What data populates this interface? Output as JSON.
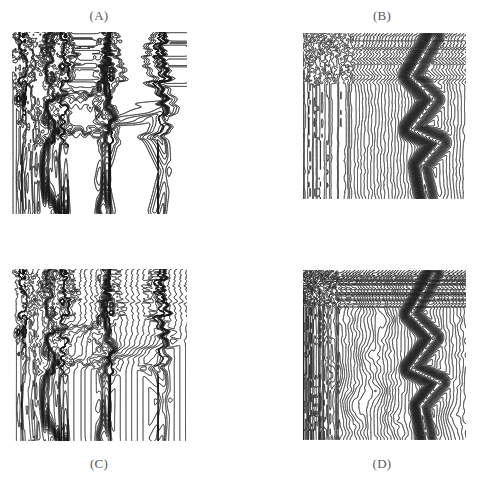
{
  "figure": {
    "kind": "multi-panel-contour-figure",
    "background_color": "#ffffff",
    "ink_color": "#1a1a1a",
    "label_color": "#58585a",
    "width": 477,
    "height": 484,
    "panel_count": 4,
    "layout": "2x2"
  },
  "panels": [
    {
      "id": "A",
      "label": "(A)",
      "label_position": "above",
      "label_x": 59,
      "label_y": 8,
      "plot_x": 12,
      "plot_y": 32,
      "plot_w": 175,
      "plot_h": 182
    },
    {
      "id": "B",
      "label": "(B)",
      "label_position": "above",
      "label_x": 342,
      "label_y": 8,
      "plot_x": 303,
      "plot_y": 33,
      "plot_w": 163,
      "plot_h": 166
    },
    {
      "id": "C",
      "label": "(C)",
      "label_position": "below",
      "label_x": 59,
      "label_y": 456,
      "plot_x": 12,
      "plot_y": 269,
      "plot_w": 175,
      "plot_h": 172
    },
    {
      "id": "D",
      "label": "(D)",
      "label_position": "below",
      "label_x": 342,
      "label_y": 456,
      "plot_x": 303,
      "plot_y": 270,
      "plot_w": 163,
      "plot_h": 170
    }
  ],
  "caption_ghost_text": "",
  "chart_data": [
    {
      "panel": "A",
      "type": "contour",
      "title": "(A)",
      "xlabel": "",
      "ylabel": "",
      "xlim": [
        0,
        1
      ],
      "ylim": [
        0,
        1
      ],
      "grid": false,
      "legend": "none",
      "n_levels": 46,
      "level_min": 0.0,
      "level_max": 1.0,
      "line_width": 0.45,
      "description": "Piecewise-flat field: broad white plateaus separated by near-vertical black fault bands; contours bunch into thick dark seams along the plateau boundaries.",
      "field_model": "plateau",
      "seeds": [
        11,
        7
      ],
      "plateaus": [
        {
          "level": 0.08,
          "cx": 0.12,
          "cy": 0.5,
          "rx": 0.11,
          "ry": 0.52
        },
        {
          "level": 0.3,
          "cx": 0.36,
          "cy": 0.2,
          "rx": 0.17,
          "ry": 0.18
        },
        {
          "level": 0.46,
          "cx": 0.36,
          "cy": 0.45,
          "rx": 0.18,
          "ry": 0.11
        },
        {
          "level": 0.58,
          "cx": 0.34,
          "cy": 0.72,
          "rx": 0.19,
          "ry": 0.17
        },
        {
          "level": 0.72,
          "cx": 0.68,
          "cy": 0.26,
          "rx": 0.14,
          "ry": 0.24
        },
        {
          "level": 0.86,
          "cx": 0.72,
          "cy": 0.7,
          "rx": 0.16,
          "ry": 0.24
        },
        {
          "level": 0.96,
          "cx": 0.95,
          "cy": 0.5,
          "rx": 0.06,
          "ry": 0.5
        }
      ],
      "ridges": [
        {
          "name": "left-seam",
          "points": [
            [
              0.06,
              0.0
            ],
            [
              0.1,
              0.18
            ],
            [
              0.07,
              0.36
            ],
            [
              0.12,
              0.55
            ],
            [
              0.08,
              0.78
            ],
            [
              0.11,
              1.0
            ]
          ],
          "weight": 0.95
        },
        {
          "name": "mid-seam",
          "points": [
            [
              0.3,
              0.0
            ],
            [
              0.33,
              0.16
            ],
            [
              0.26,
              0.34
            ],
            [
              0.3,
              0.52
            ],
            [
              0.24,
              0.7
            ],
            [
              0.28,
              1.0
            ]
          ],
          "weight": 1.0
        },
        {
          "name": "zig-seam",
          "points": [
            [
              0.56,
              0.0
            ],
            [
              0.6,
              0.22
            ],
            [
              0.5,
              0.42
            ],
            [
              0.58,
              0.62
            ],
            [
              0.52,
              0.82
            ],
            [
              0.56,
              1.0
            ]
          ],
          "weight": 0.9
        },
        {
          "name": "right-zigzag",
          "points": [
            [
              0.84,
              0.0
            ],
            [
              0.8,
              0.2
            ],
            [
              0.9,
              0.4
            ],
            [
              0.78,
              0.58
            ],
            [
              0.88,
              0.78
            ],
            [
              0.82,
              1.0
            ]
          ],
          "weight": 0.85
        }
      ]
    },
    {
      "panel": "B",
      "type": "contour",
      "title": "(B)",
      "xlabel": "",
      "ylabel": "",
      "xlim": [
        0,
        1
      ],
      "ylim": [
        0,
        1
      ],
      "grid": false,
      "legend": "none",
      "n_levels": 62,
      "level_min": 0.0,
      "level_max": 1.0,
      "line_width": 0.4,
      "description": "Monotonic left-to-right ramp producing evenly spaced near-vertical contours, wrinkled by local perturbations; a large black chevron/arrow-shaped shock of compressed contours dominates the right third.",
      "field_model": "ramp",
      "ramp_direction": "x",
      "seeds": [
        23,
        5
      ],
      "wrinkle_amplitude": 0.035,
      "wrinkle_frequency": 3.2,
      "shock": {
        "name": "chevron",
        "points": [
          [
            0.8,
            0.02
          ],
          [
            0.66,
            0.26
          ],
          [
            0.8,
            0.4
          ],
          [
            0.66,
            0.58
          ],
          [
            0.84,
            0.66
          ],
          [
            0.72,
            0.8
          ],
          [
            0.76,
            1.0
          ]
        ],
        "weight": 1.0,
        "half_width": 0.085
      }
    },
    {
      "panel": "C",
      "type": "contour",
      "title": "(C)",
      "xlabel": "",
      "ylabel": "",
      "xlim": [
        0,
        1
      ],
      "ylim": [
        0,
        1
      ],
      "grid": false,
      "legend": "none",
      "n_levels": 64,
      "level_min": 0.0,
      "level_max": 1.0,
      "line_width": 0.4,
      "description": "Same plateau topology as (A) but with a superposed fine linear ramp, so every plateau is filled with regularly spaced vertical striations while the fault seams remain solid black.",
      "field_model": "plateau+ramp",
      "seeds": [
        11,
        7
      ],
      "stripe_period": 0.0165,
      "plateaus": [
        {
          "level": 0.08,
          "cx": 0.12,
          "cy": 0.5,
          "rx": 0.11,
          "ry": 0.52
        },
        {
          "level": 0.3,
          "cx": 0.36,
          "cy": 0.2,
          "rx": 0.17,
          "ry": 0.18
        },
        {
          "level": 0.46,
          "cx": 0.36,
          "cy": 0.45,
          "rx": 0.18,
          "ry": 0.11
        },
        {
          "level": 0.58,
          "cx": 0.34,
          "cy": 0.72,
          "rx": 0.19,
          "ry": 0.17
        },
        {
          "level": 0.72,
          "cx": 0.68,
          "cy": 0.26,
          "rx": 0.14,
          "ry": 0.24
        },
        {
          "level": 0.86,
          "cx": 0.72,
          "cy": 0.7,
          "rx": 0.16,
          "ry": 0.24
        },
        {
          "level": 0.96,
          "cx": 0.95,
          "cy": 0.5,
          "rx": 0.06,
          "ry": 0.5
        }
      ],
      "ridges": [
        {
          "name": "left-seam",
          "points": [
            [
              0.06,
              0.0
            ],
            [
              0.1,
              0.18
            ],
            [
              0.07,
              0.36
            ],
            [
              0.12,
              0.55
            ],
            [
              0.08,
              0.78
            ],
            [
              0.11,
              1.0
            ]
          ],
          "weight": 0.95
        },
        {
          "name": "mid-seam",
          "points": [
            [
              0.3,
              0.0
            ],
            [
              0.33,
              0.16
            ],
            [
              0.26,
              0.34
            ],
            [
              0.3,
              0.52
            ],
            [
              0.24,
              0.7
            ],
            [
              0.28,
              1.0
            ]
          ],
          "weight": 1.0
        },
        {
          "name": "zig-seam",
          "points": [
            [
              0.56,
              0.0
            ],
            [
              0.6,
              0.22
            ],
            [
              0.5,
              0.42
            ],
            [
              0.58,
              0.62
            ],
            [
              0.52,
              0.82
            ],
            [
              0.56,
              1.0
            ]
          ],
          "weight": 0.9
        },
        {
          "name": "right-zigzag",
          "points": [
            [
              0.84,
              0.0
            ],
            [
              0.8,
              0.2
            ],
            [
              0.9,
              0.4
            ],
            [
              0.78,
              0.58
            ],
            [
              0.88,
              0.78
            ],
            [
              0.82,
              1.0
            ]
          ],
          "weight": 0.85
        }
      ]
    },
    {
      "panel": "D",
      "type": "contour",
      "title": "(D)",
      "xlabel": "",
      "ylabel": "",
      "xlim": [
        0,
        1
      ],
      "ylim": [
        0,
        1
      ],
      "grid": false,
      "legend": "none",
      "n_levels": 58,
      "level_min": 0.0,
      "level_max": 1.0,
      "line_width": 0.4,
      "description": "Turbulent version of (B): the same chevron shock persists on the right, but the left two-thirds break into many closed contour islands (local maxima and minima) with wavy interconnecting lines.",
      "field_model": "turbulent-ramp",
      "ramp_direction": "x",
      "seeds": [
        41,
        17
      ],
      "wrinkle_amplitude": 0.055,
      "wrinkle_frequency": 4.5,
      "eddies": [
        {
          "cx": 0.12,
          "cy": 0.34,
          "amp": 0.055,
          "r": 0.075
        },
        {
          "cx": 0.2,
          "cy": 0.62,
          "amp": -0.048,
          "r": 0.07
        },
        {
          "cx": 0.33,
          "cy": 0.18,
          "amp": -0.04,
          "r": 0.06
        },
        {
          "cx": 0.38,
          "cy": 0.5,
          "amp": 0.046,
          "r": 0.065
        },
        {
          "cx": 0.3,
          "cy": 0.8,
          "amp": 0.052,
          "r": 0.075
        },
        {
          "cx": 0.46,
          "cy": 0.72,
          "amp": -0.044,
          "r": 0.062
        },
        {
          "cx": 0.55,
          "cy": 0.88,
          "amp": 0.038,
          "r": 0.055
        },
        {
          "cx": 0.52,
          "cy": 0.3,
          "amp": -0.036,
          "r": 0.058
        },
        {
          "cx": 0.62,
          "cy": 0.12,
          "amp": 0.034,
          "r": 0.05
        },
        {
          "cx": 0.9,
          "cy": 0.86,
          "amp": 0.04,
          "r": 0.06
        },
        {
          "cx": 0.08,
          "cy": 0.88,
          "amp": -0.034,
          "r": 0.055
        },
        {
          "cx": 0.24,
          "cy": 0.08,
          "amp": 0.03,
          "r": 0.048
        }
      ],
      "shock": {
        "name": "chevron",
        "points": [
          [
            0.8,
            0.02
          ],
          [
            0.66,
            0.26
          ],
          [
            0.8,
            0.4
          ],
          [
            0.66,
            0.58
          ],
          [
            0.84,
            0.66
          ],
          [
            0.72,
            0.8
          ],
          [
            0.76,
            1.0
          ]
        ],
        "weight": 1.0,
        "half_width": 0.075
      }
    }
  ]
}
